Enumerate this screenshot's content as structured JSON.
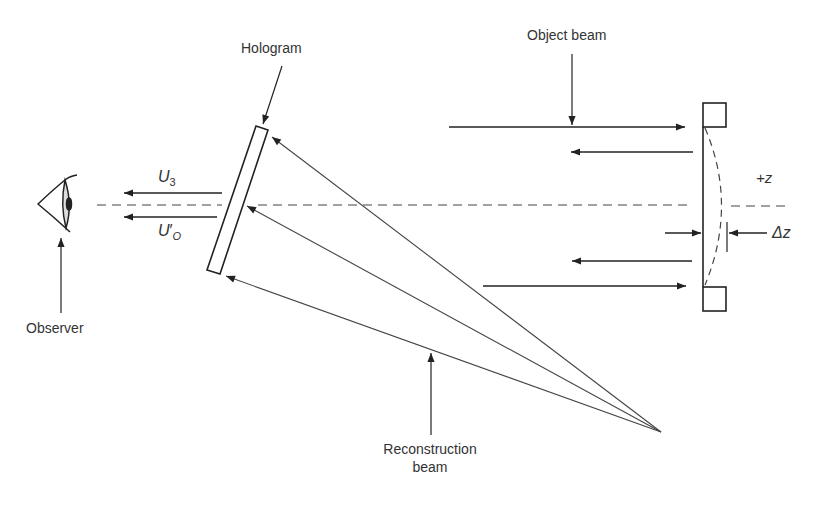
{
  "diagram": {
    "labels": {
      "hologram": "Hologram",
      "object_beam": "Object beam",
      "observer": "Observer",
      "reconstruction_line1": "Reconstruction",
      "reconstruction_line2": "beam",
      "plus_z": "+z",
      "delta_z": "Δz",
      "u3_main": "U",
      "u3_sub": "3",
      "uo_main": "U",
      "uo_prime": "′",
      "uo_sub": "O"
    },
    "components": [
      {
        "name": "observer-eye",
        "x": 38,
        "y": 205
      },
      {
        "name": "hologram-plate",
        "corners": [
          [
            256,
            126
          ],
          [
            268,
            130
          ],
          [
            219,
            274
          ],
          [
            207,
            270
          ]
        ]
      },
      {
        "name": "mirror-object",
        "x": 695,
        "y_top": 125,
        "y_bottom": 290
      },
      {
        "name": "reconstruction-source",
        "x": 661,
        "y": 432
      }
    ],
    "colors": {
      "ink": "#222222",
      "label": "#333333",
      "background": "#ffffff"
    }
  }
}
